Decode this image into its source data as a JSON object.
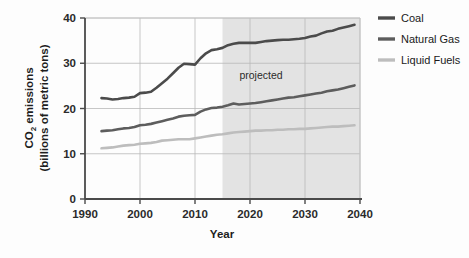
{
  "chart_data": {
    "type": "line",
    "title": "",
    "xlabel": "Year",
    "ylabel": "CO2 emissions (billions of metric tons)",
    "ylabel_line1": "CO",
    "ylabel_sub": "2",
    "ylabel_line1_rest": " emissions",
    "ylabel_line2": "(billions of metric tons)",
    "xlim": [
      1990,
      2040
    ],
    "ylim": [
      0,
      40
    ],
    "xticks": [
      1990,
      2000,
      2010,
      2020,
      2030,
      2040
    ],
    "yticks": [
      0,
      10,
      20,
      30,
      40
    ],
    "xtick_labels": [
      "1990",
      "2000",
      "2010",
      "2020",
      "2030",
      "2040"
    ],
    "ytick_labels": [
      "0",
      "10",
      "20",
      "30",
      "40"
    ],
    "grid": true,
    "legend_position": "right",
    "annotations": [
      {
        "text": "projected",
        "x": 2022,
        "y": 26.5
      }
    ],
    "shaded_region": {
      "label": "projected",
      "x_start": 2015,
      "x_end": 2040,
      "color": "#e3e3e3"
    },
    "x": [
      1993,
      1994,
      1995,
      1996,
      1997,
      1998,
      1999,
      2000,
      2001,
      2002,
      2003,
      2004,
      2005,
      2006,
      2007,
      2008,
      2009,
      2010,
      2011,
      2012,
      2013,
      2014,
      2015,
      2016,
      2017,
      2018,
      2019,
      2020,
      2021,
      2022,
      2023,
      2024,
      2025,
      2026,
      2027,
      2028,
      2029,
      2030,
      2031,
      2032,
      2033,
      2034,
      2035,
      2036,
      2037,
      2038,
      2039
    ],
    "series": [
      {
        "name": "Coal",
        "color": "#4b4b4b",
        "values": [
          22.3,
          22.2,
          22.0,
          22.1,
          22.3,
          22.4,
          22.6,
          23.4,
          23.5,
          23.7,
          24.6,
          25.6,
          26.6,
          27.8,
          29.0,
          29.9,
          29.8,
          29.7,
          31.1,
          32.2,
          32.9,
          33.1,
          33.4,
          34.0,
          34.3,
          34.5,
          34.5,
          34.5,
          34.5,
          34.7,
          34.9,
          35.0,
          35.1,
          35.2,
          35.2,
          35.3,
          35.4,
          35.6,
          35.9,
          36.1,
          36.6,
          37.0,
          37.2,
          37.6,
          37.9,
          38.2,
          38.5
        ]
      },
      {
        "name": "Natural Gas",
        "color": "#5d5d5d",
        "values": [
          15.0,
          15.1,
          15.2,
          15.4,
          15.6,
          15.7,
          15.9,
          16.3,
          16.4,
          16.6,
          16.9,
          17.2,
          17.5,
          17.8,
          18.2,
          18.4,
          18.5,
          18.6,
          19.3,
          19.8,
          20.1,
          20.2,
          20.4,
          20.7,
          21.1,
          20.9,
          21.0,
          21.1,
          21.2,
          21.4,
          21.6,
          21.8,
          22.0,
          22.2,
          22.4,
          22.5,
          22.7,
          22.9,
          23.1,
          23.3,
          23.5,
          23.8,
          24.0,
          24.2,
          24.5,
          24.8,
          25.1
        ]
      },
      {
        "name": "Liquid Fuels",
        "color": "#bdbdbd",
        "values": [
          11.2,
          11.3,
          11.4,
          11.6,
          11.8,
          11.9,
          12.0,
          12.2,
          12.3,
          12.4,
          12.6,
          12.9,
          13.0,
          13.1,
          13.2,
          13.2,
          13.2,
          13.4,
          13.6,
          13.8,
          14.0,
          14.2,
          14.3,
          14.5,
          14.7,
          14.8,
          14.9,
          15.0,
          15.1,
          15.1,
          15.2,
          15.2,
          15.3,
          15.3,
          15.4,
          15.4,
          15.5,
          15.5,
          15.6,
          15.7,
          15.8,
          15.9,
          16.0,
          16.0,
          16.1,
          16.2,
          16.3
        ]
      }
    ],
    "legend": [
      {
        "label": "Coal",
        "color": "#4b4b4b"
      },
      {
        "label": "Natural Gas",
        "color": "#5d5d5d"
      },
      {
        "label": "Liquid Fuels",
        "color": "#bdbdbd"
      }
    ]
  }
}
